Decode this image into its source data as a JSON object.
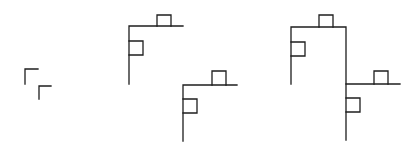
{
  "diagram": {
    "stroke_color": "#1e1e1e",
    "background": "#ffffff",
    "figures": [
      {
        "name": "stage-1",
        "paths": [
          "M25,84 L25,69 L38,69",
          "M39,99 L39,86 L51,86"
        ]
      },
      {
        "name": "stage-2",
        "paths": [
          "M129,84 L129,26 L183,26",
          "M157,26 L157,15 L171,15 L171,26",
          "M129,41 L143,41 L143,55 L129,55",
          "M183,141 L183,85 L237,85",
          "M212,85 L212,71 L226,71 L226,85",
          "M183,99 L197,99 L197,113 L183,113"
        ]
      },
      {
        "name": "stage-3",
        "paths": [
          "M291,84 L291,27 L346,27 L346,140",
          "M319,27 L319,15 L333,15 L333,27",
          "M291,42 L305,42 L305,56 L291,56",
          "M346,84 L400,84",
          "M374,84 L374,71 L388,71 L388,84",
          "M346,98 L360,98 L360,112 L346,112"
        ]
      }
    ]
  }
}
